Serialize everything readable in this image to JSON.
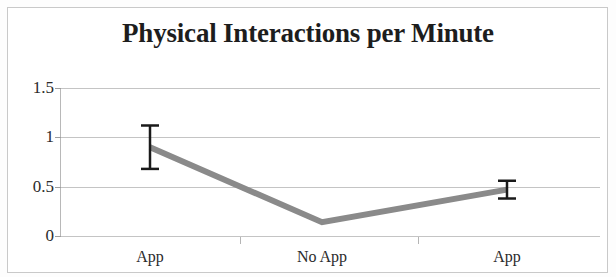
{
  "chart_data": {
    "type": "line",
    "title": "Physical Interactions per Minute",
    "xlabel": "",
    "ylabel": "",
    "categories": [
      "App",
      "No App",
      "App"
    ],
    "values": [
      0.9,
      0.14,
      0.47
    ],
    "errors": [
      0.22,
      0.0,
      0.09
    ],
    "series": [
      {
        "name": "Physical Interactions per Minute",
        "values": [
          0.9,
          0.14,
          0.47
        ]
      }
    ],
    "ylim": [
      0,
      1.5
    ],
    "ytick_labels": [
      "0",
      "0.5",
      "1",
      "1.5"
    ],
    "ytick_values": [
      0,
      0.5,
      1,
      1.5
    ],
    "grid": true,
    "legend": false,
    "line_color": "#8a8a8a",
    "error_bar_color": "#1a1a1a",
    "grid_color": "#c4c4c4",
    "axis_color": "#b8b8b8",
    "background_color": "#ffffff"
  },
  "axis": {
    "y": {
      "t0": "1.5",
      "t1": "1",
      "t2": "0.5",
      "t3": "0"
    },
    "x": {
      "t0": "App",
      "t1": "No App",
      "t2": "App"
    }
  }
}
